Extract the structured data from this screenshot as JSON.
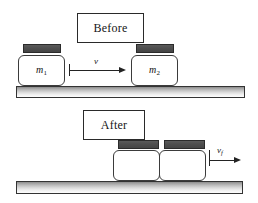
{
  "figure": {
    "background_color": "#ffffff"
  },
  "panels": [
    {
      "id": "before",
      "caption": "Before",
      "blocks": [
        {
          "label": "m",
          "subscript": "1"
        },
        {
          "label": "m",
          "subscript": "2"
        }
      ],
      "velocity": {
        "symbol": "v",
        "subscript": "",
        "direction": "right"
      }
    },
    {
      "id": "after",
      "caption": "After",
      "blocks": [
        {
          "label": "",
          "subscript": ""
        },
        {
          "label": "",
          "subscript": ""
        }
      ],
      "velocity": {
        "symbol": "v",
        "subscript": "f",
        "direction": "right"
      }
    }
  ],
  "labels": {
    "before_caption": "Before",
    "after_caption": "After",
    "mass_one_symbol": "m",
    "mass_one_sub": "1",
    "mass_two_symbol": "m",
    "mass_two_sub": "2",
    "velocity_initial_symbol": "v",
    "velocity_final_symbol": "v",
    "velocity_final_sub": "f"
  },
  "colors": {
    "block_cap": "#4e4e4e",
    "block_body": "#ffffff",
    "outline": "#333333",
    "ground_top": "#8b8b8b",
    "ground_bottom": "#fdfdfd",
    "text": "#161616"
  }
}
